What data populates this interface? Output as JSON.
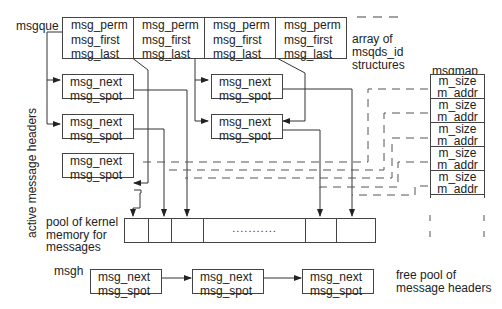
{
  "labels": {
    "msgque": "msgque",
    "array_desc": [
      "array of",
      "msqds_id",
      "structures"
    ],
    "msgmap": "msgmap",
    "active_headers": "active message headers",
    "pool_desc": [
      "pool of kernel",
      "memory for",
      "messages"
    ],
    "msgh": "msgh",
    "free_pool": [
      "free pool of",
      "message headers"
    ],
    "pool_dots": "..........."
  },
  "msqid_array": [
    {
      "fields": [
        "msg_perm",
        "msg_first",
        "msg_last"
      ]
    },
    {
      "fields": [
        "msg_perm",
        "msg_first",
        "msg_last"
      ]
    },
    {
      "fields": [
        "msg_perm",
        "msg_first",
        "msg_last"
      ]
    },
    {
      "fields": [
        "msg_perm",
        "msg_first",
        "msg_last"
      ]
    }
  ],
  "active_headers": [
    {
      "id": "h1",
      "fields": [
        "msg_next",
        "msg_spot"
      ]
    },
    {
      "id": "h2",
      "fields": [
        "msg_next",
        "msg_spot"
      ]
    },
    {
      "id": "h3",
      "fields": [
        "msg_next",
        "msg_spot"
      ]
    },
    {
      "id": "h4",
      "fields": [
        "msg_next",
        "msg_spot"
      ]
    },
    {
      "id": "h5",
      "fields": [
        "msg_next",
        "msg_spot"
      ]
    }
  ],
  "msgmap_entries": [
    {
      "fields": [
        "m_size",
        "m_addr"
      ]
    },
    {
      "fields": [
        "m_size",
        "m_addr"
      ]
    },
    {
      "fields": [
        "m_size",
        "m_addr"
      ]
    },
    {
      "fields": [
        "m_size",
        "m_addr"
      ]
    },
    {
      "fields": [
        "m_size",
        "m_addr"
      ]
    }
  ],
  "free_headers": [
    {
      "fields": [
        "msg_next",
        "msg_spot"
      ]
    },
    {
      "fields": [
        "msg_next",
        "msg_spot"
      ]
    },
    {
      "fields": [
        "msg_next",
        "msg_spot"
      ]
    }
  ],
  "colors": {
    "line": "#333333",
    "box_border": "#444444",
    "text": "#222222",
    "background": "#ffffff"
  }
}
